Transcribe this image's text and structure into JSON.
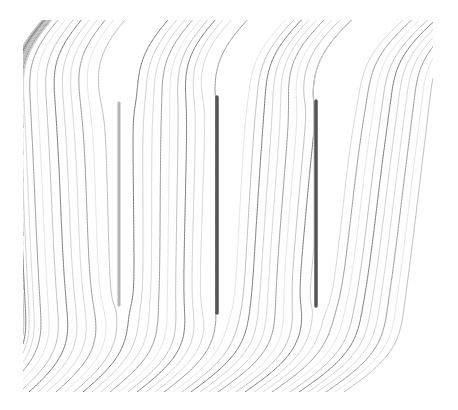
{
  "figure": {
    "type": "streamline-diagram",
    "canvas": {
      "width": 458,
      "height": 410,
      "background": "#ffffff"
    },
    "frame": {
      "x0": 23,
      "y0": 20,
      "x1": 433,
      "y1": 392
    },
    "flow_direction": "bottom-left to top-right",
    "plates": [
      {
        "id": "plate-1",
        "x": 119,
        "y_top": 103,
        "y_bottom": 305,
        "color": "#b4b4b4",
        "width": 3
      },
      {
        "id": "plate-2",
        "x": 217,
        "y_top": 97,
        "y_bottom": 313,
        "color": "#555555",
        "width": 3.5
      },
      {
        "id": "plate-3",
        "x": 316,
        "y_top": 101,
        "y_bottom": 306,
        "color": "#555555",
        "width": 3.5
      }
    ],
    "streamlines": {
      "count": 70,
      "spacing": 9,
      "stroke_colors": [
        "#d6d6d6",
        "#9a9a9a",
        "#e4e4e4",
        "#bdbdbd",
        "#7a7a7a",
        "#cfcfcf"
      ],
      "stroke_width": 1
    }
  }
}
